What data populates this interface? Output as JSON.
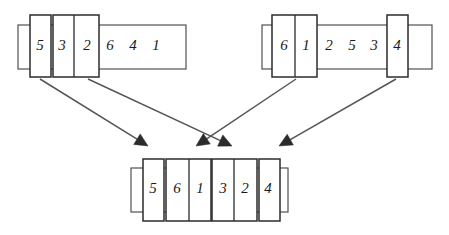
{
  "diagram": {
    "colors": {
      "background": "#ffffff",
      "box_stroke": "#2b2b2b",
      "outer_stroke": "#4a4a4a",
      "arrow": "#555555",
      "text": "#1a1a1a"
    },
    "arrays": [
      {
        "id": "left-source-array",
        "name": "left-array",
        "outer": {
          "x": 18,
          "y": 25,
          "w": 168,
          "h": 44
        },
        "values": [
          "5",
          "3",
          "2",
          "6",
          "4",
          "1"
        ],
        "cells": [
          {
            "label": "5",
            "cx": 40,
            "cy": 47
          },
          {
            "label": "3",
            "cx": 62,
            "cy": 47
          },
          {
            "label": "2",
            "cx": 87,
            "cy": 47
          },
          {
            "label": "6",
            "cx": 110,
            "cy": 47
          },
          {
            "label": "4",
            "cx": 133,
            "cy": 47
          },
          {
            "label": "1",
            "cx": 156,
            "cy": 47
          }
        ],
        "groups": [
          {
            "id": "left-group-5",
            "label": "5",
            "x": 30,
            "y": 15,
            "w": 21,
            "h": 62
          },
          {
            "id": "left-group-32",
            "label": "3 2",
            "x": 53,
            "y": 15,
            "w": 46,
            "h": 62,
            "divider_x": 74
          }
        ]
      },
      {
        "id": "right-source-array",
        "name": "right-array",
        "outer": {
          "x": 262,
          "y": 25,
          "w": 170,
          "h": 44
        },
        "values": [
          "6",
          "1",
          "2",
          "5",
          "3",
          "4"
        ],
        "cells": [
          {
            "label": "6",
            "cx": 284,
            "cy": 47
          },
          {
            "label": "1",
            "cx": 306,
            "cy": 47
          },
          {
            "label": "2",
            "cx": 329,
            "cy": 47
          },
          {
            "label": "5",
            "cx": 352,
            "cy": 47
          },
          {
            "label": "3",
            "cx": 374,
            "cy": 47
          },
          {
            "label": "4",
            "cx": 397,
            "cy": 47
          }
        ],
        "groups": [
          {
            "id": "right-group-61",
            "label": "6 1",
            "x": 272,
            "y": 15,
            "w": 45,
            "h": 62,
            "divider_x": 295
          },
          {
            "id": "right-group-4",
            "label": "4",
            "x": 387,
            "y": 15,
            "w": 21,
            "h": 62
          }
        ]
      },
      {
        "id": "result-array",
        "name": "merged-array",
        "outer": {
          "x": 131,
          "y": 168,
          "w": 157,
          "h": 44
        },
        "values": [
          "5",
          "6",
          "1",
          "3",
          "2",
          "4"
        ],
        "cells": [
          {
            "label": "5",
            "cx": 153,
            "cy": 190
          },
          {
            "label": "6",
            "cx": 177,
            "cy": 190
          },
          {
            "label": "1",
            "cx": 200,
            "cy": 190
          },
          {
            "label": "3",
            "cx": 223,
            "cy": 190
          },
          {
            "label": "2",
            "cx": 245,
            "cy": 190
          },
          {
            "label": "4",
            "cx": 268,
            "cy": 190
          }
        ],
        "groups": [
          {
            "id": "result-group-5",
            "label": "5",
            "x": 143,
            "y": 159,
            "w": 21,
            "h": 62
          },
          {
            "id": "result-group-61",
            "label": "6 1",
            "x": 166,
            "y": 159,
            "w": 45,
            "h": 62,
            "divider_x": 189
          },
          {
            "id": "result-group-32",
            "label": "3 2",
            "x": 212,
            "y": 159,
            "w": 45,
            "h": 62,
            "divider_x": 234
          },
          {
            "id": "result-group-4",
            "label": "4",
            "x": 259,
            "y": 159,
            "w": 21,
            "h": 62
          }
        ]
      }
    ],
    "arrows": [
      {
        "id": "arrow-left-5-to-result-5",
        "from": "left-group-5",
        "to": "result-group-5",
        "x1": 40,
        "y1": 79,
        "x2": 148,
        "y2": 146
      },
      {
        "id": "arrow-left-32-to-result-32",
        "from": "left-group-32",
        "to": "result-group-32",
        "x1": 88,
        "y1": 79,
        "x2": 232,
        "y2": 146
      },
      {
        "id": "arrow-right-61-to-result-61",
        "from": "right-group-61",
        "to": "result-group-61",
        "x1": 296,
        "y1": 79,
        "x2": 196,
        "y2": 146
      },
      {
        "id": "arrow-right-4-to-result-4",
        "from": "right-group-4",
        "to": "result-group-4",
        "x1": 396,
        "y1": 79,
        "x2": 279,
        "y2": 146
      }
    ]
  }
}
